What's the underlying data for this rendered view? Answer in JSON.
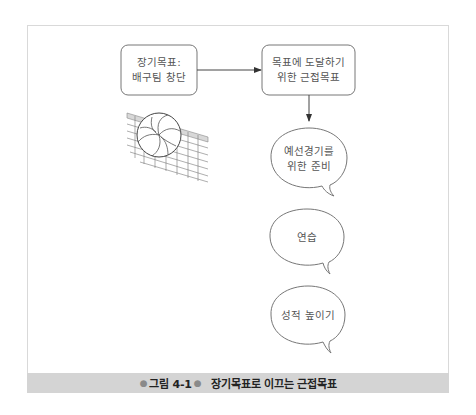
{
  "figure": {
    "caption_number": "그림 4-1",
    "caption_title": "장기목표로 이끄는 근접목표",
    "caption_dot": "●"
  },
  "nodes": {
    "long_term_goal": {
      "lines": [
        "장기목표:",
        "배구팀 창단"
      ]
    },
    "proximal_goal": {
      "lines": [
        "목표에 도달하기",
        "위한 근접목표"
      ]
    },
    "bubbles": [
      {
        "lines": [
          "예선경기를",
          "위한 준비"
        ]
      },
      {
        "lines": [
          "연습"
        ]
      },
      {
        "lines": [
          "성적 높이기"
        ]
      }
    ]
  },
  "illustration": {
    "icon": "volleyball-net-icon"
  },
  "colors": {
    "stroke": "#666666",
    "caption_band": "#d4d4d4",
    "frame": "#d9d9d9"
  }
}
